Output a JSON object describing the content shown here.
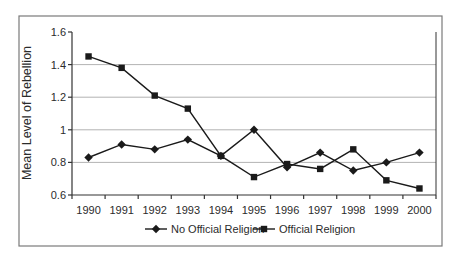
{
  "figure": {
    "background": "#ffffff",
    "border_color": "#7a7a7a"
  },
  "chart_data": {
    "type": "line",
    "title": "",
    "xlabel": "",
    "ylabel": "Mean Level of Rebellion",
    "categories": [
      "1990",
      "1991",
      "1992",
      "1993",
      "1994",
      "1995",
      "1996",
      "1997",
      "1998",
      "1999",
      "2000"
    ],
    "ylim": [
      0.6,
      1.6
    ],
    "ytick_step": 0.2,
    "ytick_labels": [
      "0.6",
      "0.8",
      "1",
      "1.2",
      "1.4",
      "1.6"
    ],
    "grid": true,
    "gridline_color": "#b3b3b3",
    "axis_color": "#333333",
    "legend_position": "bottom-center",
    "series": [
      {
        "name": "No Official Religion",
        "marker": "diamond",
        "color": "#1a1a1a",
        "values": [
          0.83,
          0.91,
          0.88,
          0.94,
          0.84,
          1.0,
          0.77,
          0.86,
          0.75,
          0.8,
          0.86
        ]
      },
      {
        "name": "Official Religion",
        "marker": "square",
        "color": "#1a1a1a",
        "values": [
          1.45,
          1.38,
          1.21,
          1.13,
          0.84,
          0.71,
          0.79,
          0.76,
          0.88,
          0.69,
          0.64
        ]
      }
    ]
  }
}
